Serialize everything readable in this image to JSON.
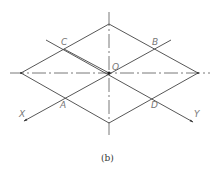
{
  "diagram": {
    "caption": "(b)",
    "colors": {
      "line": "#444444",
      "label": "#777777",
      "background": "#ffffff"
    },
    "points": {
      "O": {
        "label": "O",
        "x": 109,
        "y": 73
      },
      "A": {
        "label": "A",
        "x": 64,
        "y": 98
      },
      "B": {
        "label": "B",
        "x": 154,
        "y": 49
      },
      "C": {
        "label": "C",
        "x": 64,
        "y": 49
      },
      "D": {
        "label": "D",
        "x": 154,
        "y": 98
      }
    },
    "rhombus_vertices": {
      "top": {
        "x": 109,
        "y": 24
      },
      "right": {
        "x": 198,
        "y": 73
      },
      "bottom": {
        "x": 109,
        "y": 123
      },
      "left": {
        "x": 21,
        "y": 73
      }
    },
    "axes": {
      "x": {
        "label": "X",
        "from": {
          "x": 171,
          "y": 40
        },
        "to": {
          "x": 24,
          "y": 121
        },
        "arrow": true
      },
      "y": {
        "label": "Y",
        "from": {
          "x": 46,
          "y": 40
        },
        "to": {
          "x": 193,
          "y": 122
        },
        "arrow": true
      },
      "horizontal_centerline": {
        "from": {
          "x": 10,
          "y": 73
        },
        "to": {
          "x": 210,
          "y": 73
        },
        "style": "dash-dot"
      },
      "vertical_centerline": {
        "from": {
          "x": 109,
          "y": 12
        },
        "to": {
          "x": 109,
          "y": 135
        },
        "style": "dash-dot"
      }
    }
  }
}
